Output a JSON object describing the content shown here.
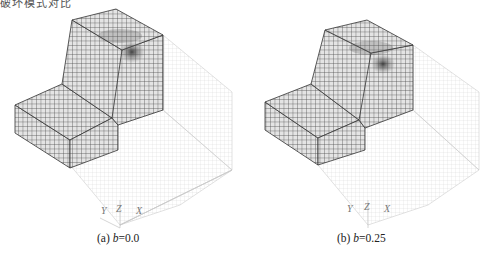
{
  "header": {
    "cropped_text": "破坏模式对比"
  },
  "figures": [
    {
      "id": "a",
      "caption_prefix": "(a) ",
      "caption_var": "b",
      "caption_value": "=0.0",
      "axes": {
        "y": "Y",
        "z": "Z",
        "x": "X"
      }
    },
    {
      "id": "b",
      "caption_prefix": "(b) ",
      "caption_var": "b",
      "caption_value": "=0.25",
      "axes": {
        "y": "Y",
        "z": "Z",
        "x": "X"
      }
    }
  ],
  "colors": {
    "mesh_dark": "#3a3a3a",
    "mesh_fill": "#d8d8d8",
    "mesh_ghost": "#d0d0d0",
    "damage_zone": "#555555"
  }
}
